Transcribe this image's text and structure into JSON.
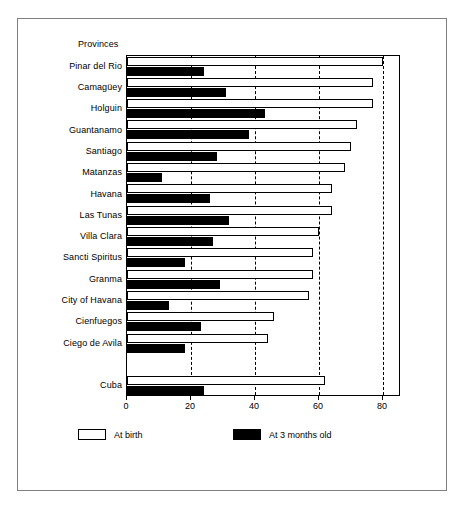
{
  "figure": {
    "axis_header": "Provinces"
  },
  "legend": [
    {
      "label": "At birth",
      "swatch": "white-square-icon",
      "color": "#ffffff"
    },
    {
      "label": "At 3 months old",
      "swatch": "black-square-icon",
      "color": "#000000"
    }
  ],
  "chart_data": {
    "type": "bar",
    "orientation": "horizontal",
    "title": "",
    "subtitle": "",
    "xlabel": "",
    "ylabel": "Provinces",
    "xlim": [
      0,
      85.6
    ],
    "ylim": null,
    "grid": true,
    "grid_axis": "x",
    "legend_position": "bottom",
    "xticks": [
      0,
      20,
      40,
      60,
      80
    ],
    "xticklabels": [
      "0",
      "20",
      "40",
      "60",
      "80"
    ],
    "categories": [
      "Pinar del Rio",
      "Camagüey",
      "Holguin",
      "Guantanamo",
      "Santiago",
      "Matanzas",
      "Havana",
      "Las Tunas",
      "Villa Clara",
      "Sancti Spiritus",
      "Granma",
      "City of Havana",
      "Cienfuegos",
      "Ciego de Avila",
      "",
      "Cuba"
    ],
    "series": [
      {
        "name": "At birth",
        "color": "#ffffff",
        "values": [
          80,
          77,
          77,
          72,
          70,
          68,
          64,
          64,
          60,
          58,
          58,
          57,
          46,
          44,
          null,
          62
        ]
      },
      {
        "name": "At 3 months old",
        "color": "#000000",
        "values": [
          24,
          31,
          43,
          38,
          28,
          11,
          26,
          32,
          27,
          18,
          29,
          13,
          23,
          18,
          null,
          24
        ]
      }
    ]
  }
}
